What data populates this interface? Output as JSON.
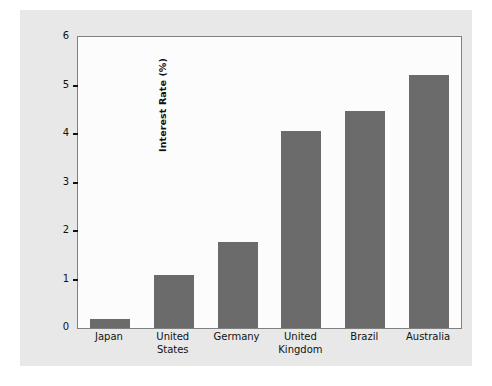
{
  "chart_data": {
    "type": "bar",
    "title": "",
    "subtitle": "",
    "xlabel": "",
    "ylabel": "Interest Rate (%)",
    "categories": [
      "Japan",
      "United States",
      "Germany",
      "United Kingdom",
      "Brazil",
      "Australia"
    ],
    "category_lines": [
      [
        "Japan"
      ],
      [
        "United",
        "States"
      ],
      [
        "Germany"
      ],
      [
        "United",
        "Kingdom"
      ],
      [
        "Brazil"
      ],
      [
        "Australia"
      ]
    ],
    "values": [
      0.18,
      1.09,
      1.77,
      4.06,
      4.47,
      5.22
    ],
    "ylim": [
      0,
      6
    ],
    "xlim": [
      0,
      6
    ],
    "yticks": [
      0,
      1,
      2,
      3,
      4,
      5,
      6
    ],
    "ytick_labels": [
      "0",
      "1",
      "2",
      "3",
      "4",
      "5",
      "6"
    ],
    "grid": false,
    "legend": null,
    "legend_position": "none",
    "bar_color": "#6b6b6b",
    "plot_background_color": "#fcfcfc",
    "figure_background_color": "#e8e8e8",
    "axis_color": "#808080",
    "text_color": "#111111",
    "bar_width_px": 40,
    "annotations": []
  },
  "axis": {
    "y_label_text": "Interest Rate (%)"
  }
}
